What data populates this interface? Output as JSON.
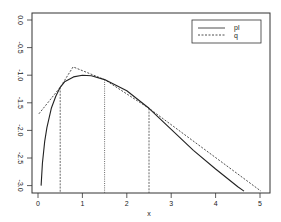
{
  "chart_data": {
    "type": "line",
    "title": "",
    "xlabel": "x",
    "ylabel": "",
    "xlim": [
      -0.15,
      5.15
    ],
    "ylim": [
      -3.15,
      0.12
    ],
    "x_ticks": [
      0,
      1,
      2,
      3,
      4,
      5
    ],
    "x_tick_labels": [
      "0",
      "1",
      "2",
      "3",
      "4",
      "5"
    ],
    "y_ticks": [
      0.0,
      -0.5,
      -1.0,
      -1.5,
      -2.0,
      -2.5,
      -3.0
    ],
    "y_tick_labels": [
      "0.0",
      "-0.5",
      "-1.0",
      "-1.5",
      "-2.0",
      "-2.5",
      "-3.0"
    ],
    "grid": false,
    "legend_position": "top-right",
    "series": [
      {
        "name": "pl",
        "style": "solid",
        "x": [
          0.07,
          0.1,
          0.15,
          0.2,
          0.3,
          0.4,
          0.5,
          0.6,
          0.8,
          1.0,
          1.2,
          1.5,
          2.0,
          2.5,
          3.0,
          3.5,
          4.0,
          4.5,
          4.64
        ],
        "y": [
          -3.0,
          -2.6,
          -2.2,
          -1.95,
          -1.6,
          -1.38,
          -1.22,
          -1.12,
          -1.03,
          -1.0,
          -1.01,
          -1.08,
          -1.28,
          -1.6,
          -1.98,
          -2.36,
          -2.7,
          -3.02,
          -3.1
        ]
      },
      {
        "name": "q",
        "style": "dashed",
        "x": [
          0.02,
          0.5,
          0.79,
          1.5,
          2.5,
          5.02
        ],
        "y": [
          -1.7,
          -1.22,
          -0.85,
          -1.08,
          -1.6,
          -3.1
        ]
      }
    ],
    "vertical_lines": [
      {
        "x": 0.5,
        "y_top": -1.22,
        "style": "dashed"
      },
      {
        "x": 1.5,
        "y_top": -1.08,
        "style": "dotted"
      },
      {
        "x": 2.5,
        "y_top": -1.6,
        "style": "dashed"
      }
    ]
  },
  "legend": {
    "items": [
      {
        "label": "pl",
        "style": "solid"
      },
      {
        "label": "q",
        "style": "dashed"
      }
    ]
  },
  "axes": {
    "xlabel": "x"
  }
}
